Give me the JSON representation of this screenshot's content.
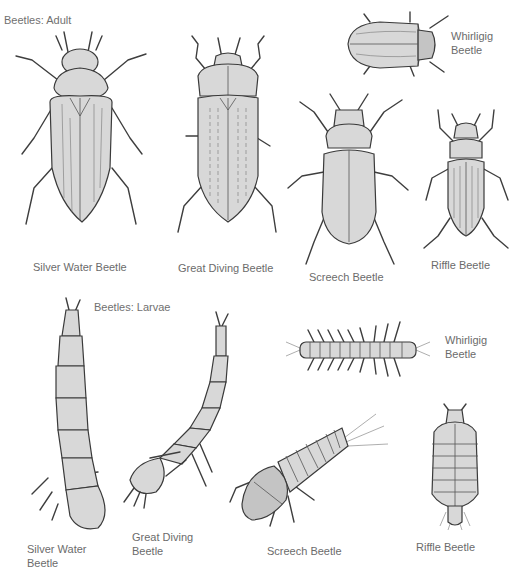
{
  "figure": {
    "sections": {
      "adult": {
        "title": "Beetles: Adult"
      },
      "larvae": {
        "title": "Beetles: Larvae"
      }
    },
    "adults": [
      {
        "id": "silver-water-beetle",
        "label": "Silver Water Beetle"
      },
      {
        "id": "great-diving-beetle",
        "label": "Great Diving Beetle"
      },
      {
        "id": "whirligig-beetle",
        "label_line1": "Whirligig",
        "label_line2": "Beetle"
      },
      {
        "id": "screech-beetle",
        "label": "Screech Beetle"
      },
      {
        "id": "riffle-beetle",
        "label": "Riffle Beetle"
      }
    ],
    "larvae": [
      {
        "id": "silver-water-beetle-larva",
        "label_line1": "Silver Water",
        "label_line2": "Beetle"
      },
      {
        "id": "great-diving-beetle-larva",
        "label_line1": "Great Diving",
        "label_line2": "Beetle"
      },
      {
        "id": "whirligig-beetle-larva",
        "label_line1": "Whirligig",
        "label_line2": "Beetle"
      },
      {
        "id": "screech-beetle-larva",
        "label": "Screech Beetle"
      },
      {
        "id": "riffle-beetle-larva",
        "label": "Riffle Beetle"
      }
    ]
  }
}
